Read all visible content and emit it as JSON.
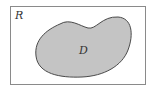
{
  "diagram": {
    "outer_region": {
      "label": "R",
      "fill": "#ffffff",
      "stroke": "#8a8a8a"
    },
    "inner_region": {
      "label": "D",
      "fill": "#c4c4c4",
      "stroke": "#4a4a4a"
    }
  }
}
